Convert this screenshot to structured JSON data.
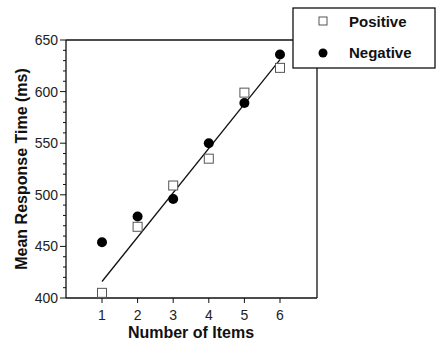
{
  "chart_data": {
    "type": "scatter",
    "title": "",
    "xlabel": "Number of Items",
    "ylabel": "Mean Response Time (ms)",
    "x": [
      1,
      2,
      3,
      4,
      5,
      6
    ],
    "xticks": [
      "1",
      "2",
      "3",
      "4",
      "5",
      "6"
    ],
    "xlim": [
      0,
      7
    ],
    "ylim": [
      400,
      650
    ],
    "yticks": [
      400,
      450,
      500,
      550,
      600,
      650
    ],
    "yminor_step": 10,
    "grid": false,
    "legend_position": "top-right",
    "series": [
      {
        "name": "Positive",
        "marker": "open-square",
        "values": [
          405,
          469,
          509,
          535,
          599,
          623
        ]
      },
      {
        "name": "Negative",
        "marker": "filled-circle",
        "values": [
          454,
          479,
          496,
          550,
          589,
          636
        ]
      }
    ],
    "fit_line": {
      "x": [
        1,
        6
      ],
      "y": [
        416,
        631
      ]
    }
  }
}
